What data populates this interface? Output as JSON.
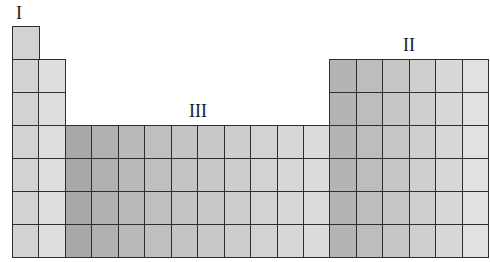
{
  "diagram": {
    "type": "periodic-table-outline",
    "columns": 18,
    "rows": 7,
    "labels": [
      {
        "text": "I",
        "col": 1,
        "x": 19,
        "y": 4
      },
      {
        "text": "II",
        "col": 16,
        "x": 409,
        "y": 36
      },
      {
        "text": "III",
        "col": 8,
        "x": 198,
        "y": 102
      }
    ],
    "regions": [
      {
        "name": "column-1",
        "cols": [
          1,
          1
        ],
        "rows": [
          1,
          7
        ]
      },
      {
        "name": "column-2",
        "cols": [
          2,
          2
        ],
        "rows": [
          2,
          7
        ]
      },
      {
        "name": "transition-block",
        "cols": [
          3,
          12
        ],
        "rows": [
          4,
          7
        ]
      },
      {
        "name": "p-block",
        "cols": [
          13,
          18
        ],
        "rows": [
          2,
          7
        ]
      }
    ],
    "column_shades": [
      "#d2d2d2",
      "#dedede",
      "#a9a9a9",
      "#b1b1b1",
      "#b9b9b9",
      "#bfbfbf",
      "#c4c4c4",
      "#c9c9c9",
      "#cdcdcd",
      "#d2d2d2",
      "#d7d7d7",
      "#dcdcdc",
      "#b4b4b4",
      "#bdbdbd",
      "#c6c6c6",
      "#cfcfcf",
      "#d8d8d8",
      "#e1e1e1"
    ],
    "grid": {
      "left": 12,
      "top": 26,
      "cell_w": 26.45,
      "cell_h": 33
    }
  }
}
